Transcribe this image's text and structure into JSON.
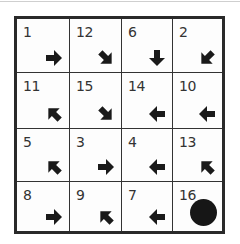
{
  "puzzle": {
    "rows": 4,
    "cols": 4,
    "cells": [
      {
        "number": "1",
        "arrow": "E"
      },
      {
        "number": "12",
        "arrow": "SE"
      },
      {
        "number": "6",
        "arrow": "S"
      },
      {
        "number": "2",
        "arrow": "SW"
      },
      {
        "number": "11",
        "arrow": "NW"
      },
      {
        "number": "15",
        "arrow": "SE"
      },
      {
        "number": "14",
        "arrow": "W"
      },
      {
        "number": "10",
        "arrow": "W"
      },
      {
        "number": "5",
        "arrow": "NW"
      },
      {
        "number": "3",
        "arrow": "E"
      },
      {
        "number": "4",
        "arrow": "W"
      },
      {
        "number": "13",
        "arrow": "NW"
      },
      {
        "number": "8",
        "arrow": "E"
      },
      {
        "number": "9",
        "arrow": "NW"
      },
      {
        "number": "7",
        "arrow": "W"
      },
      {
        "number": "16",
        "arrow": "goal-dot"
      }
    ]
  },
  "colors": {
    "ink": "#1a1a1a",
    "border": "#2a2a2a",
    "background": "#ffffff"
  }
}
